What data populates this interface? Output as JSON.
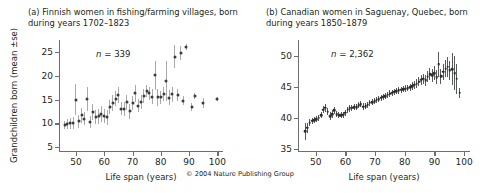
{
  "figure": {
    "copyright": "© 2004 Nature Publishing Group"
  },
  "panel_a": {
    "title": "(a) Finnish women in fishing/farming villages, born during years 1702–1823",
    "n_label_prefix": "n",
    "n_label_eq": " = ",
    "n_label_value": "339",
    "ylabel": "Grandchildren born (mean ±se)",
    "xlabel": "Life span (years)"
  },
  "panel_b": {
    "title": "(b) Canadian women in Saguenay, Quebec, born during years 1850–1879",
    "n_label_prefix": "n",
    "n_label_eq": " = ",
    "n_label_value": "2,362",
    "xlabel": "Life span (years)"
  },
  "chart_data": [
    {
      "type": "scatter",
      "panel": "a",
      "title": "(a) Finnish women in fishing/farming villages, born during years 1702–1823",
      "xlabel": "Life span (years)",
      "ylabel": "Grandchildren born (mean ±se)",
      "annotation": "n = 339",
      "n": 339,
      "xlim": [
        44,
        102
      ],
      "ylim": [
        4,
        27.5
      ],
      "xticks": [
        50,
        60,
        70,
        80,
        90,
        100
      ],
      "yticks": [
        5,
        10,
        15,
        20,
        25
      ],
      "grid": false,
      "legend": null,
      "error_bars": "mean ±se",
      "points": [
        {
          "x": 46,
          "y": 9.7,
          "se": 0.9
        },
        {
          "x": 47,
          "y": 9.9,
          "se": 1.0
        },
        {
          "x": 48,
          "y": 10.0,
          "se": 1.1
        },
        {
          "x": 49,
          "y": 10.1,
          "se": 1.2
        },
        {
          "x": 50,
          "y": 15.0,
          "se": 3.3
        },
        {
          "x": 51,
          "y": 10.4,
          "se": 1.3
        },
        {
          "x": 52,
          "y": 11.7,
          "se": 1.6
        },
        {
          "x": 53,
          "y": 11.0,
          "se": 1.4
        },
        {
          "x": 54,
          "y": 15.1,
          "se": 2.6
        },
        {
          "x": 55,
          "y": 10.3,
          "se": 1.2
        },
        {
          "x": 56,
          "y": 12.4,
          "se": 1.6
        },
        {
          "x": 57,
          "y": 11.4,
          "se": 1.5
        },
        {
          "x": 58,
          "y": 11.5,
          "se": 1.6
        },
        {
          "x": 59,
          "y": 12.0,
          "se": 1.7
        },
        {
          "x": 60,
          "y": 11.6,
          "se": 1.5
        },
        {
          "x": 61,
          "y": 11.3,
          "se": 1.6
        },
        {
          "x": 62,
          "y": 13.5,
          "se": 1.5
        },
        {
          "x": 63,
          "y": 14.3,
          "se": 1.6
        },
        {
          "x": 64,
          "y": 15.2,
          "se": 1.6
        },
        {
          "x": 65,
          "y": 16.0,
          "se": 1.7
        },
        {
          "x": 66,
          "y": 13.1,
          "se": 1.4
        },
        {
          "x": 67,
          "y": 13.0,
          "se": 1.4
        },
        {
          "x": 68,
          "y": 14.4,
          "se": 1.5
        },
        {
          "x": 69,
          "y": 12.5,
          "se": 1.5
        },
        {
          "x": 70,
          "y": 14.3,
          "se": 1.4
        },
        {
          "x": 71,
          "y": 16.3,
          "se": 1.8
        },
        {
          "x": 72,
          "y": 13.7,
          "se": 1.4
        },
        {
          "x": 73,
          "y": 14.5,
          "se": 1.4
        },
        {
          "x": 74,
          "y": 15.8,
          "se": 1.5
        },
        {
          "x": 75,
          "y": 16.8,
          "se": 1.3
        },
        {
          "x": 76,
          "y": 16.3,
          "se": 1.3
        },
        {
          "x": 77,
          "y": 15.6,
          "se": 1.6
        },
        {
          "x": 78,
          "y": 20.1,
          "se": 3.0
        },
        {
          "x": 79,
          "y": 15.5,
          "se": 1.8
        },
        {
          "x": 80,
          "y": 15.5,
          "se": 1.4
        },
        {
          "x": 81,
          "y": 16.1,
          "se": 1.5
        },
        {
          "x": 82,
          "y": 18.8,
          "se": 4.2
        },
        {
          "x": 83,
          "y": 15.4,
          "se": 1.6
        },
        {
          "x": 84,
          "y": 16.1,
          "se": 1.6
        },
        {
          "x": 85,
          "y": 24.0,
          "se": 2.4
        },
        {
          "x": 86,
          "y": 15.9,
          "se": 1.3
        },
        {
          "x": 87,
          "y": 24.8,
          "se": 1.4
        },
        {
          "x": 88,
          "y": 14.8,
          "se": 1.0
        },
        {
          "x": 89,
          "y": 26.0,
          "se": 0.6
        },
        {
          "x": 91,
          "y": 13.4,
          "se": 0.8
        },
        {
          "x": 92,
          "y": 15.8,
          "se": 0.6
        },
        {
          "x": 95,
          "y": 14.3,
          "se": 1.0
        },
        {
          "x": 100,
          "y": 15.1,
          "se": 0.5
        }
      ]
    },
    {
      "type": "scatter",
      "panel": "b",
      "title": "(b) Canadian women in Saguenay, Quebec, born during years 1850–1879",
      "xlabel": "Life span (years)",
      "ylabel": "Grandchildren born (mean ±se)",
      "annotation": "n = 2,362",
      "n": 2362,
      "xlim": [
        44,
        102
      ],
      "ylim": [
        34.5,
        52.5
      ],
      "xticks": [
        50,
        60,
        70,
        80,
        90,
        100
      ],
      "yticks": [
        35,
        40,
        45,
        50
      ],
      "grid": false,
      "legend": null,
      "error_bars": "mean ±se",
      "points": [
        {
          "x": 46.5,
          "y": 37.8,
          "se": 1.3
        },
        {
          "x": 47.2,
          "y": 38.4,
          "se": 0.8
        },
        {
          "x": 48.0,
          "y": 39.2,
          "se": 0.6
        },
        {
          "x": 48.8,
          "y": 39.5,
          "se": 0.5
        },
        {
          "x": 49.5,
          "y": 39.6,
          "se": 0.5
        },
        {
          "x": 50.2,
          "y": 39.8,
          "se": 0.5
        },
        {
          "x": 51.0,
          "y": 40.0,
          "se": 0.5
        },
        {
          "x": 51.8,
          "y": 40.4,
          "se": 0.5
        },
        {
          "x": 52.5,
          "y": 41.3,
          "se": 0.6
        },
        {
          "x": 53.2,
          "y": 41.6,
          "se": 0.6
        },
        {
          "x": 54.0,
          "y": 41.0,
          "se": 0.6
        },
        {
          "x": 54.8,
          "y": 40.3,
          "se": 0.6
        },
        {
          "x": 55.5,
          "y": 40.6,
          "se": 0.6
        },
        {
          "x": 56.2,
          "y": 41.2,
          "se": 0.6
        },
        {
          "x": 57.0,
          "y": 40.6,
          "se": 0.5
        },
        {
          "x": 57.8,
          "y": 40.4,
          "se": 0.5
        },
        {
          "x": 58.5,
          "y": 40.4,
          "se": 0.5
        },
        {
          "x": 59.2,
          "y": 40.5,
          "se": 0.5
        },
        {
          "x": 60.0,
          "y": 40.8,
          "se": 0.5
        },
        {
          "x": 60.8,
          "y": 41.3,
          "se": 0.5
        },
        {
          "x": 61.5,
          "y": 41.5,
          "se": 0.5
        },
        {
          "x": 62.2,
          "y": 41.6,
          "se": 0.5
        },
        {
          "x": 63.0,
          "y": 41.7,
          "se": 0.5
        },
        {
          "x": 63.8,
          "y": 41.7,
          "se": 0.5
        },
        {
          "x": 64.5,
          "y": 42.0,
          "se": 0.5
        },
        {
          "x": 65.2,
          "y": 42.2,
          "se": 0.5
        },
        {
          "x": 66.0,
          "y": 41.8,
          "se": 0.5
        },
        {
          "x": 66.8,
          "y": 41.9,
          "se": 0.5
        },
        {
          "x": 67.5,
          "y": 42.1,
          "se": 0.5
        },
        {
          "x": 68.2,
          "y": 42.4,
          "se": 0.5
        },
        {
          "x": 69.0,
          "y": 42.5,
          "se": 0.5
        },
        {
          "x": 69.8,
          "y": 42.7,
          "se": 0.5
        },
        {
          "x": 70.5,
          "y": 42.9,
          "se": 0.5
        },
        {
          "x": 71.2,
          "y": 43.0,
          "se": 0.5
        },
        {
          "x": 72.0,
          "y": 43.2,
          "se": 0.5
        },
        {
          "x": 72.8,
          "y": 43.4,
          "se": 0.5
        },
        {
          "x": 73.5,
          "y": 43.5,
          "se": 0.5
        },
        {
          "x": 74.2,
          "y": 43.7,
          "se": 0.5
        },
        {
          "x": 75.0,
          "y": 43.9,
          "se": 0.5
        },
        {
          "x": 75.8,
          "y": 44.0,
          "se": 0.5
        },
        {
          "x": 76.5,
          "y": 44.2,
          "se": 0.5
        },
        {
          "x": 77.2,
          "y": 44.3,
          "se": 0.5
        },
        {
          "x": 78.0,
          "y": 44.4,
          "se": 0.5
        },
        {
          "x": 78.8,
          "y": 44.5,
          "se": 0.5
        },
        {
          "x": 79.5,
          "y": 44.6,
          "se": 0.5
        },
        {
          "x": 80.2,
          "y": 44.7,
          "se": 0.5
        },
        {
          "x": 81.0,
          "y": 44.8,
          "se": 0.5
        },
        {
          "x": 81.8,
          "y": 44.9,
          "se": 0.6
        },
        {
          "x": 82.5,
          "y": 45.1,
          "se": 0.6
        },
        {
          "x": 83.2,
          "y": 45.3,
          "se": 0.6
        },
        {
          "x": 84.0,
          "y": 45.5,
          "se": 0.7
        },
        {
          "x": 84.8,
          "y": 45.8,
          "se": 0.7
        },
        {
          "x": 85.5,
          "y": 46.1,
          "se": 0.8
        },
        {
          "x": 86.2,
          "y": 46.3,
          "se": 0.8
        },
        {
          "x": 87.0,
          "y": 46.0,
          "se": 0.9
        },
        {
          "x": 87.8,
          "y": 46.6,
          "se": 0.9
        },
        {
          "x": 88.5,
          "y": 47.0,
          "se": 1.0
        },
        {
          "x": 89.2,
          "y": 46.8,
          "se": 1.0
        },
        {
          "x": 90.0,
          "y": 47.2,
          "se": 1.1
        },
        {
          "x": 90.8,
          "y": 46.5,
          "se": 1.1
        },
        {
          "x": 91.5,
          "y": 48.6,
          "se": 2.0
        },
        {
          "x": 92.2,
          "y": 46.7,
          "se": 1.2
        },
        {
          "x": 93.0,
          "y": 47.4,
          "se": 1.3
        },
        {
          "x": 93.8,
          "y": 47.9,
          "se": 1.4
        },
        {
          "x": 94.5,
          "y": 48.2,
          "se": 1.6
        },
        {
          "x": 95.2,
          "y": 47.6,
          "se": 1.6
        },
        {
          "x": 96.0,
          "y": 47.8,
          "se": 2.6
        },
        {
          "x": 96.8,
          "y": 47.2,
          "se": 2.8
        },
        {
          "x": 97.5,
          "y": 46.3,
          "se": 2.4
        },
        {
          "x": 98.5,
          "y": 44.0,
          "se": 0.8
        }
      ]
    }
  ]
}
